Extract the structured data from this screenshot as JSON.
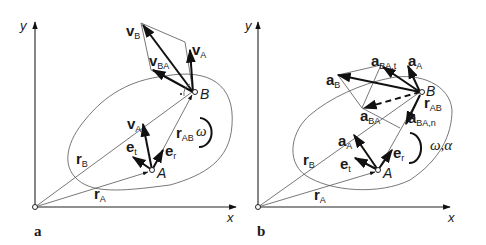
{
  "panels": [
    {
      "id": "a",
      "panel_label": "a",
      "axis_x": "x",
      "axis_y": "y",
      "points": {
        "A": "A",
        "B": "B"
      },
      "vectors": {
        "vB": {
          "sym": "v",
          "sub": "B"
        },
        "vA_top": {
          "sym": "v",
          "sub": "A"
        },
        "vBA": {
          "sym": "v",
          "sub": "BA"
        },
        "vA": {
          "sym": "v",
          "sub": "A"
        },
        "rAB": {
          "sym": "r",
          "sub": "AB"
        },
        "et": {
          "sym": "e",
          "sub": "t"
        },
        "er": {
          "sym": "e",
          "sub": "r"
        },
        "rB": {
          "sym": "r",
          "sub": "B"
        },
        "rA": {
          "sym": "r",
          "sub": "A"
        }
      },
      "rotation": "ω"
    },
    {
      "id": "b",
      "panel_label": "b",
      "axis_x": "x",
      "axis_y": "y",
      "points": {
        "A": "A",
        "B": "B"
      },
      "vectors": {
        "aBAt": {
          "sym": "a",
          "sub": "BA,t"
        },
        "aA_top": {
          "sym": "a",
          "sub": "A"
        },
        "aB": {
          "sym": "a",
          "sub": "B"
        },
        "rAB": {
          "sym": "r",
          "sub": "AB"
        },
        "aBA": {
          "sym": "a",
          "sub": "BA"
        },
        "aBAn": {
          "sym": "a",
          "sub": "BA,n"
        },
        "aA": {
          "sym": "a",
          "sub": "A"
        },
        "et": {
          "sym": "e",
          "sub": "t"
        },
        "er": {
          "sym": "e",
          "sub": "r"
        },
        "rB": {
          "sym": "r",
          "sub": "B"
        },
        "rA": {
          "sym": "r",
          "sub": "A"
        }
      },
      "rotation": "ω,α"
    }
  ]
}
